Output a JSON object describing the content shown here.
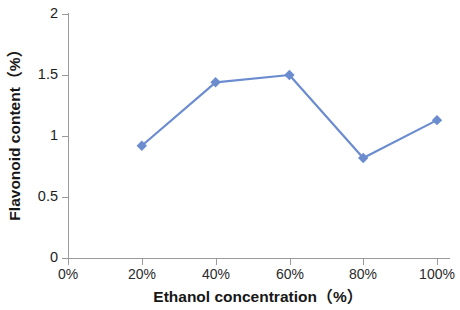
{
  "chart_data": {
    "type": "line",
    "title": "",
    "xlabel": "Ethanol concentration（%）",
    "ylabel": "Flavonoid content（%）",
    "categories": [
      "0%",
      "20%",
      "40%",
      "60%",
      "80%",
      "100%"
    ],
    "x": [
      20,
      40,
      60,
      80,
      100
    ],
    "x_tick_labels": [
      "0%",
      "20%",
      "40%",
      "60%",
      "80%",
      "100%"
    ],
    "y_tick_labels": [
      "0",
      "0.5",
      "1",
      "1.5",
      "2"
    ],
    "y_ticks": [
      0,
      0.5,
      1,
      1.5,
      2
    ],
    "xlim": [
      0,
      100
    ],
    "ylim": [
      0,
      2
    ],
    "grid": false,
    "legend": false,
    "legend_position": "none",
    "series": [
      {
        "name": "Flavonoid content",
        "color": "#6B8CCF",
        "marker": "diamond",
        "x": [
          20,
          40,
          60,
          80,
          100
        ],
        "values": [
          0.92,
          1.44,
          1.5,
          0.82,
          1.13
        ]
      }
    ]
  },
  "axes": {
    "x_title": "Ethanol concentration（%）",
    "y_title": "Flavonoid content（%）",
    "x_ticks": [
      {
        "label": "0%",
        "value": 0
      },
      {
        "label": "20%",
        "value": 20
      },
      {
        "label": "40%",
        "value": 40
      },
      {
        "label": "60%",
        "value": 60
      },
      {
        "label": "80%",
        "value": 80
      },
      {
        "label": "100%",
        "value": 100
      }
    ],
    "y_ticks": [
      {
        "label": "0",
        "value": 0
      },
      {
        "label": "0.5",
        "value": 0.5
      },
      {
        "label": "1",
        "value": 1
      },
      {
        "label": "1.5",
        "value": 1.5
      },
      {
        "label": "2",
        "value": 2
      }
    ]
  },
  "style": {
    "line_color": "#6B8CCF",
    "marker_color": "#6B8CCF",
    "axis_color": "#9A9A9A",
    "background": "#FFFFFF",
    "text_color": "#1A1A1A"
  }
}
